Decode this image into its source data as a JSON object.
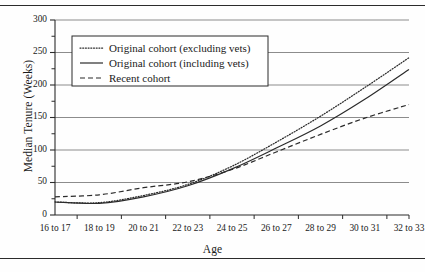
{
  "chart_data": {
    "type": "line",
    "title": "",
    "xlabel": "Age",
    "ylabel": "Median Tenure (Weeks)",
    "categories": [
      "16 to 17",
      "18 to 19",
      "20 to 21",
      "22 to 23",
      "24 to 25",
      "26 to 27",
      "28 to 29",
      "30 to 31",
      "32 to 33"
    ],
    "ylim": [
      0,
      300
    ],
    "yticks": [
      0,
      50,
      100,
      150,
      200,
      250,
      300
    ],
    "ytick_labels": [
      "0",
      "50",
      "100",
      "150",
      "200",
      "250",
      "300"
    ],
    "yminor_ticks": [
      25,
      75,
      125,
      175,
      225,
      275
    ],
    "grid": "horizontal",
    "legend_position": "upper-left-inside",
    "series": [
      {
        "name": "Original cohort (excluding vets)",
        "style": "dotted",
        "values": [
          20,
          19,
          30,
          47,
          75,
          112,
          152,
          196,
          242
        ]
      },
      {
        "name": "Original cohort (including vets)",
        "style": "solid",
        "values": [
          20,
          18,
          28,
          45,
          71,
          103,
          137,
          178,
          224
        ]
      },
      {
        "name": "Recent cohort",
        "style": "dashed",
        "values": [
          28,
          31,
          42,
          51,
          70,
          97,
          124,
          149,
          170
        ]
      }
    ]
  },
  "axes": {
    "x_title": "Age",
    "y_title": "Median Tenure (Weeks)"
  },
  "legend": {
    "entries": [
      {
        "label": "Original cohort (excluding vets)",
        "style": "dotted"
      },
      {
        "label": "Original cohort (including vets)",
        "style": "solid"
      },
      {
        "label": "Recent cohort",
        "style": "dashed"
      }
    ]
  },
  "colors": {
    "line": "#2b2b2b",
    "grid": "#8c8c8c",
    "axis": "#2b2b2b",
    "text": "#1a1a1a",
    "background": "#fefefe"
  }
}
